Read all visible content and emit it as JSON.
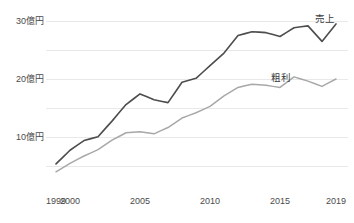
{
  "chart_data": {
    "type": "line",
    "title": "",
    "subtitle": "",
    "xlabel": "",
    "ylabel": "",
    "grid": true,
    "grid_orientation": "horizontal",
    "legend_position": "inline-right-of-line-end",
    "xlim": [
      1999,
      2019
    ],
    "ylim": [
      0,
      31
    ],
    "x": [
      1999,
      2000,
      2001,
      2002,
      2003,
      2004,
      2005,
      2006,
      2007,
      2008,
      2009,
      2010,
      2011,
      2012,
      2013,
      2014,
      2015,
      2016,
      2017,
      2018,
      2019
    ],
    "xtick_labels": [
      "1999",
      "2000",
      "2005",
      "2010",
      "2015",
      "2019"
    ],
    "xtick_values": [
      1999,
      2000,
      2005,
      2010,
      2015,
      2019
    ],
    "ytick_labels": [
      "10億円",
      "20億円",
      "30億円"
    ],
    "ytick_values": [
      10,
      20,
      30
    ],
    "gridline_values": [
      5,
      10,
      15,
      20,
      25,
      30
    ],
    "unit_note": "億円",
    "series": [
      {
        "name": "売上",
        "color": "#4d4d4d",
        "width": 1.6,
        "label_x": 2018.2,
        "label_y": 30.3,
        "values": [
          3.2,
          4.6,
          5.6,
          6.0,
          7.6,
          9.3,
          10.4,
          9.8,
          9.5,
          11.6,
          12.0,
          13.3,
          14.6,
          16.4,
          16.8,
          16.7,
          16.3,
          17.2,
          17.4,
          15.8,
          17.6
        ]
      },
      {
        "name": "粗利",
        "color": "#a8a8a8",
        "width": 1.5,
        "label_x": 2015.1,
        "label_y": 20.2,
        "values": [
          2.2,
          3.0,
          3.7,
          4.3,
          5.2,
          5.9,
          6.0,
          5.8,
          6.4,
          7.3,
          7.8,
          8.4,
          9.4,
          10.2,
          10.5,
          10.4,
          10.2,
          11.2,
          10.8,
          10.3,
          11.0
        ]
      }
    ],
    "series_full": {
      "売上": {
        "years": [
          1999,
          2000,
          2001,
          2002,
          2003,
          2004,
          2005,
          2006,
          2007,
          2008,
          2009,
          2010,
          2011,
          2012,
          2013,
          2014,
          2015,
          2016,
          2017,
          2018,
          2019
        ],
        "values": [
          3.2,
          4.6,
          5.6,
          6.1,
          7.7,
          9.4,
          10.5,
          9.8,
          9.4,
          11.7,
          12.1,
          13.4,
          14.7,
          16.5,
          16.9,
          16.6,
          16.2,
          17.3,
          17.4,
          15.8,
          17.6
        ]
      }
    },
    "annotations": [
      {
        "text": "売上",
        "series": "売上",
        "at_x": 2018.2,
        "at_y": 30.3
      },
      {
        "text": "粗利",
        "series": "粗利",
        "at_x": 2015.1,
        "at_y": 20.2
      }
    ]
  },
  "axes": {
    "y_ticks": [
      {
        "label": "10億円",
        "value": 10
      },
      {
        "label": "20億円",
        "value": 20
      },
      {
        "label": "30億円",
        "value": 30
      }
    ],
    "x_ticks": [
      {
        "label": "1999",
        "value": 1999
      },
      {
        "label": "2000",
        "value": 2000
      },
      {
        "label": "2005",
        "value": 2005
      },
      {
        "label": "2010",
        "value": 2010
      },
      {
        "label": "2015",
        "value": 2015
      },
      {
        "label": "2019",
        "value": 2019
      }
    ]
  },
  "colors": {
    "background": "#ffffff",
    "grid": "#e9e9e9",
    "sales_line": "#4d4d4d",
    "gross_profit_line": "#a8a8a8",
    "tick_text": "#4a4a4a",
    "label_text": "#3a3a3a"
  }
}
